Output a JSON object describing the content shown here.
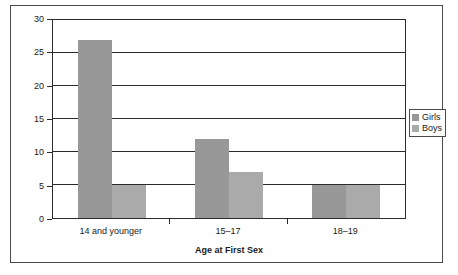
{
  "chart_data": {
    "type": "bar",
    "title": "",
    "subtitle": "",
    "xlabel": "Age at First Sex",
    "ylabel": "",
    "categories": [
      "14 and younger",
      "15–17",
      "18–19"
    ],
    "series": [
      {
        "name": "Girls",
        "values": [
          27,
          12,
          5
        ],
        "color": "#989898"
      },
      {
        "name": "Boys",
        "values": [
          5,
          7,
          5
        ],
        "color": "#aaaaaa"
      }
    ],
    "ylim": [
      0,
      30
    ],
    "ytick_values": [
      0,
      5,
      10,
      15,
      20,
      25,
      30
    ],
    "ytick_labels": [
      "0",
      "5",
      "10",
      "15",
      "20",
      "25",
      "30"
    ],
    "grid": true,
    "grid_axis": "y",
    "legend_position": "right",
    "legend_entries": [
      "Girls",
      "Boys"
    ],
    "bar_border_color": "#2b2b2b",
    "axis_color": "#2b2b2b",
    "frame_color": "#4a4a4a",
    "background": "#ffffff"
  },
  "figure": {
    "frame_label": "chart-frame"
  }
}
